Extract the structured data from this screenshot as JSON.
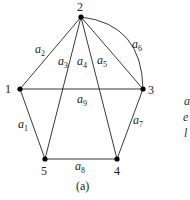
{
  "figure": {
    "caption": "(a)",
    "vertices": [
      {
        "id": "1",
        "label": "1"
      },
      {
        "id": "2",
        "label": "2"
      },
      {
        "id": "3",
        "label": "3"
      },
      {
        "id": "4",
        "label": "4"
      },
      {
        "id": "5",
        "label": "5"
      }
    ],
    "edges": [
      {
        "id": "a1",
        "name": "a",
        "sub": "1",
        "from": "1",
        "to": "5"
      },
      {
        "id": "a2",
        "name": "a",
        "sub": "2",
        "from": "1",
        "to": "2"
      },
      {
        "id": "a3",
        "name": "a",
        "sub": "3",
        "from": "2",
        "to": "5"
      },
      {
        "id": "a4",
        "name": "a",
        "sub": "4",
        "from": "2",
        "to": "4"
      },
      {
        "id": "a5",
        "name": "a",
        "sub": "5",
        "from": "2",
        "to": "3"
      },
      {
        "id": "a6",
        "name": "a",
        "sub": "6",
        "from": "2",
        "to": "3",
        "curved": true
      },
      {
        "id": "a7",
        "name": "a",
        "sub": "7",
        "from": "3",
        "to": "4"
      },
      {
        "id": "a8",
        "name": "a",
        "sub": "8",
        "from": "5",
        "to": "4"
      },
      {
        "id": "a9",
        "name": "a",
        "sub": "9",
        "from": "1",
        "to": "3"
      }
    ],
    "side_text_fragments": [
      "a",
      "e",
      "l"
    ]
  }
}
